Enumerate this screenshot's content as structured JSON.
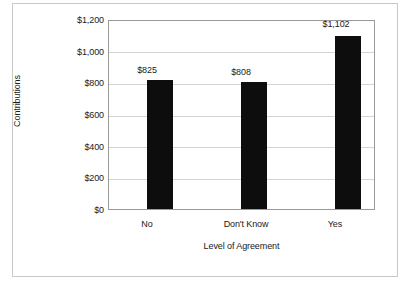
{
  "chart_data": {
    "type": "bar",
    "title": "",
    "categories": [
      "No",
      "Don't Know",
      "Yes"
    ],
    "values": [
      825,
      808,
      1102
    ],
    "value_labels": [
      "$825",
      "$808",
      "$1,102"
    ],
    "series": [
      {
        "name": "Contributions",
        "values": [
          825,
          808,
          1102
        ]
      }
    ],
    "xlabel": "Level of Agreement",
    "ylabel": "Contributions",
    "ylim": [
      0,
      1200
    ],
    "ytick_values": [
      0,
      200,
      400,
      600,
      800,
      1000,
      1200
    ],
    "ytick_labels": [
      "$0",
      "$200",
      "$400",
      "$600",
      "$800",
      "$1,000",
      "$1,200"
    ],
    "grid": "horizontal",
    "legend": "none",
    "bar_color": "#0d0d0d",
    "gridline_color": "#d4d4d4",
    "axis_color": "#9a9a9a",
    "background_color": "#ffffff"
  }
}
